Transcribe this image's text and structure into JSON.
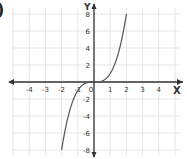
{
  "label_prefix": ")",
  "chart_data": {
    "type": "line",
    "title": "",
    "function": "y = x^3",
    "xlabel": "X",
    "ylabel": "Y",
    "xlim": [
      -5,
      5.5
    ],
    "ylim": [
      -8,
      9
    ],
    "x_ticks": [
      -4,
      -3,
      -2,
      -1,
      0,
      1,
      2,
      3,
      4
    ],
    "x_tick_labels": [
      "-4",
      "-3",
      "-2",
      "-1",
      "0",
      "1",
      "2",
      "3",
      "4"
    ],
    "y_ticks": [
      -8,
      -6,
      -4,
      -2,
      2,
      4,
      6,
      8
    ],
    "y_tick_labels": [
      "-8",
      "-6",
      "-4",
      "-2",
      "2",
      "4",
      "6",
      "8"
    ],
    "grid": true,
    "series": [
      {
        "name": "y = x^3",
        "x": [
          -2,
          -1.75,
          -1.5,
          -1.25,
          -1,
          -0.75,
          -0.5,
          -0.25,
          0,
          0.25,
          0.5,
          0.75,
          1,
          1.25,
          1.5,
          1.75,
          2
        ],
        "y": [
          -8,
          -5.36,
          -3.375,
          -1.95,
          -1,
          -0.42,
          -0.125,
          -0.016,
          0,
          0.016,
          0.125,
          0.42,
          1,
          1.95,
          3.375,
          5.36,
          8
        ]
      }
    ],
    "colors": {
      "curve": "#555555",
      "axes": "#333333",
      "grid": "#e6e6e6",
      "text": "#333333"
    }
  }
}
